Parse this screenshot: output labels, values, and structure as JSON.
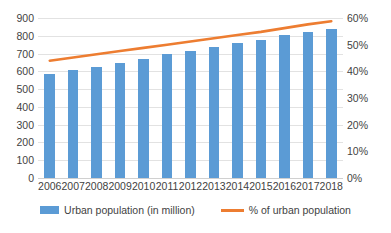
{
  "chart_data": {
    "type": "bar",
    "title": "",
    "subtitle": "",
    "xlabel": "",
    "ylabel": "",
    "grid": true,
    "legend_position": "bottom",
    "categories": [
      "2006",
      "2007",
      "2008",
      "2009",
      "2010",
      "2011",
      "2012",
      "2013",
      "2014",
      "2015",
      "2016",
      "2017",
      "2018"
    ],
    "axes": {
      "left": {
        "label": "",
        "ylim": [
          0,
          900
        ],
        "tick_step": 100,
        "ticks": [
          "900",
          "800",
          "700",
          "600",
          "500",
          "400",
          "300",
          "200",
          "100",
          "0"
        ],
        "tick_values": [
          900,
          800,
          700,
          600,
          500,
          400,
          300,
          200,
          100,
          0
        ]
      },
      "right": {
        "label": "",
        "ylim": [
          0,
          60
        ],
        "tick_step": 10,
        "ticks": [
          "60%",
          "50%",
          "40%",
          "30%",
          "20%",
          "10%",
          "0%"
        ],
        "tick_values": [
          60,
          50,
          40,
          30,
          20,
          10,
          0
        ]
      }
    },
    "series": [
      {
        "name": "Urban population (in million)",
        "type": "bar",
        "axis": "left",
        "color": "#5B9BD5",
        "values": [
          585,
          605,
          625,
          648,
          672,
          695,
          716,
          737,
          757,
          779,
          802,
          822,
          841
        ]
      },
      {
        "name": "% of urban population",
        "type": "line",
        "axis": "right",
        "color": "#ED7D31",
        "values": [
          44.0,
          45.2,
          46.4,
          47.6,
          48.8,
          50.0,
          51.2,
          52.4,
          53.6,
          54.8,
          56.2,
          57.6,
          58.8
        ]
      }
    ]
  },
  "legend": {
    "items": [
      {
        "label": "Urban population (in million)",
        "marker": "bar-swatch",
        "color": "#5B9BD5"
      },
      {
        "label": "% of urban population",
        "marker": "line-swatch",
        "color": "#ED7D31"
      }
    ]
  }
}
